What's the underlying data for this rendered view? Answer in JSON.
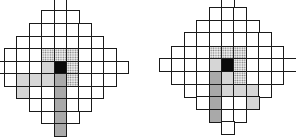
{
  "figure": {
    "panels": [
      {
        "id": "left",
        "origin_x": -8.5,
        "origin_y": 0,
        "cell_w": 12.4,
        "cell_h": 12.4,
        "row_offsets_y": [
          -2.4,
          10,
          23,
          35.5,
          48,
          60.5,
          73,
          85.5,
          98,
          110.5,
          123
        ],
        "center": {
          "row": 5,
          "col": 5
        },
        "radius": 5,
        "shading": {
          "dotted": [
            [
              4,
              4
            ],
            [
              4,
              5
            ],
            [
              4,
              6
            ],
            [
              5,
              6
            ],
            [
              6,
              6
            ]
          ],
          "black": [
            [
              5,
              5
            ]
          ],
          "light": [
            [
              5,
              4
            ],
            [
              6,
              2
            ],
            [
              6,
              3
            ],
            [
              6,
              4
            ],
            [
              7,
              2
            ]
          ],
          "medium": [
            [
              6,
              5
            ],
            [
              7,
              5
            ],
            [
              8,
              5
            ],
            [
              9,
              5
            ],
            [
              10,
              5
            ]
          ]
        }
      },
      {
        "id": "right",
        "origin_x": 159,
        "origin_y": 0,
        "cell_w": 12.4,
        "cell_h": 12.6,
        "row_offsets_y": [
          -5.6,
          7,
          19.6,
          32.2,
          45.8,
          58.4,
          71,
          83.6,
          96.2,
          108.8,
          121.4
        ],
        "center": {
          "row": 5,
          "col": 5
        },
        "radius": 5,
        "shading": {
          "dotted": [
            [
              4,
              4
            ],
            [
              4,
              5
            ],
            [
              4,
              6
            ],
            [
              5,
              6
            ],
            [
              6,
              6
            ]
          ],
          "black": [
            [
              5,
              5
            ]
          ],
          "light": [
            [
              5,
              4
            ],
            [
              6,
              5
            ],
            [
              7,
              5
            ],
            [
              7,
              6
            ],
            [
              7,
              7
            ],
            [
              8,
              7
            ]
          ],
          "medium": [
            [
              6,
              4
            ],
            [
              7,
              4
            ],
            [
              8,
              4
            ],
            [
              9,
              4
            ]
          ]
        }
      }
    ],
    "legend_colors": {
      "black": "#0a0a0a",
      "light": "#d6d6d6",
      "medium": "#a9a9a9",
      "dotted": "#ececec",
      "grid_line": "#1a1a1a"
    }
  }
}
